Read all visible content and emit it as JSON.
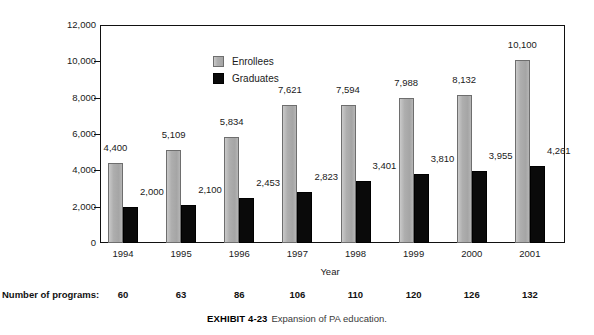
{
  "chart_data": {
    "type": "bar",
    "title": "",
    "xlabel": "Year",
    "ylabel": "",
    "ylim": [
      0,
      12000
    ],
    "ytick_step": 2000,
    "ytick_labels": [
      "12,000",
      "10,000",
      "8,000",
      "6,000",
      "4,000",
      "2,000",
      "0"
    ],
    "ytick_values": [
      12000,
      10000,
      8000,
      6000,
      4000,
      2000,
      0
    ],
    "grid": false,
    "legend_position": "inside-top-left",
    "categories": [
      "1994",
      "1995",
      "1996",
      "1997",
      "1998",
      "1999",
      "2000",
      "2001"
    ],
    "series": [
      {
        "name": "Enrollees",
        "color": "#a8a8a8",
        "values": [
          4400,
          5109,
          5834,
          7621,
          7594,
          7988,
          8132,
          10100
        ],
        "labels": [
          "4,400",
          "5,109",
          "5,834",
          "7,621",
          "7,594",
          "7,988",
          "8,132",
          "10,100"
        ]
      },
      {
        "name": "Graduates",
        "color": "#000000",
        "values": [
          2000,
          2100,
          2453,
          2823,
          3401,
          3810,
          3955,
          4261
        ],
        "labels": [
          "2,000",
          "2,100",
          "2,453",
          "2,823",
          "3,401",
          "3,810",
          "3,955",
          "4,261"
        ]
      }
    ],
    "annotation_row": {
      "label": "Number of programs:",
      "values": [
        "60",
        "63",
        "86",
        "106",
        "110",
        "120",
        "126",
        "132"
      ]
    }
  },
  "caption": {
    "label": "EXHIBIT 4-23",
    "text": "Expansion of PA education."
  }
}
